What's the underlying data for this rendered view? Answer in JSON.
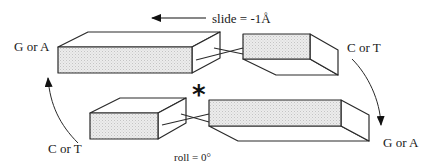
{
  "diagram": {
    "annotations": {
      "slide": "slide = -1Å",
      "roll": "roll = 0°",
      "star": "*"
    },
    "labels": {
      "top_left": "G or A",
      "top_right": "C or T",
      "bottom_left": "C or T",
      "bottom_right": "G or A"
    },
    "colors": {
      "stroke": "#2a2a2a",
      "shaded_face": "#e6e6e6",
      "face": "#ffffff"
    },
    "blocks": [
      {
        "name": "top-left-base",
        "shaded_face": "front"
      },
      {
        "name": "top-right-base",
        "shaded_face": "front"
      },
      {
        "name": "bottom-left-base",
        "shaded_face": "front"
      },
      {
        "name": "bottom-right-base",
        "shaded_face": "front"
      }
    ],
    "arrows": [
      {
        "name": "slide-arrow",
        "direction": "left"
      },
      {
        "name": "left-curved-arrow",
        "direction": "up"
      },
      {
        "name": "right-curved-arrow",
        "direction": "down"
      }
    ]
  }
}
